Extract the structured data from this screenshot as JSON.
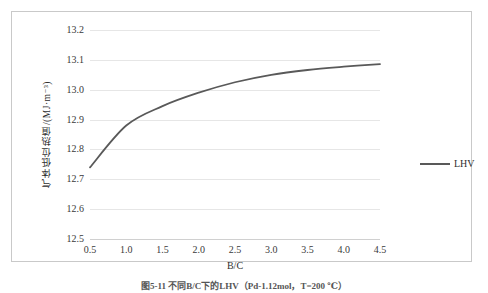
{
  "figure": {
    "caption": "图5-11  不同B/C下的LHV（Pd-1.12mol，T=200 ℃）"
  },
  "legend": {
    "position": "right",
    "entries": [
      {
        "label": "LHV",
        "color": "#595959"
      }
    ]
  },
  "axes": {
    "x": {
      "title": "B/C",
      "ticks": [
        "0.5",
        "1.0",
        "1.5",
        "2.0",
        "2.5",
        "3.0",
        "3.5",
        "4.0",
        "4.5"
      ]
    },
    "y": {
      "title": "气体低位热值/(MJ·m⁻³)",
      "ticks": [
        "12.5",
        "12.6",
        "12.7",
        "12.8",
        "12.9",
        "13.0",
        "13.1",
        "13.2"
      ]
    }
  },
  "chart_data": {
    "type": "line",
    "title": "",
    "xlabel": "B/C",
    "ylabel": "气体低位热值/(MJ·m⁻³)",
    "xlim": [
      0.5,
      4.5
    ],
    "ylim": [
      12.5,
      13.2
    ],
    "grid": true,
    "legend_position": "right",
    "x": [
      0.5,
      1.0,
      1.5,
      2.0,
      2.5,
      3.0,
      3.5,
      4.0,
      4.5
    ],
    "series": [
      {
        "name": "LHV",
        "color": "#595959",
        "values": [
          12.74,
          12.88,
          12.945,
          12.99,
          13.025,
          13.05,
          13.066,
          13.077,
          13.086
        ]
      }
    ]
  },
  "style": {
    "line_color": "#595959",
    "grid_color": "#e6e6e6",
    "frame_color": "#c9c9c9",
    "text_color": "#2f2f2f"
  }
}
